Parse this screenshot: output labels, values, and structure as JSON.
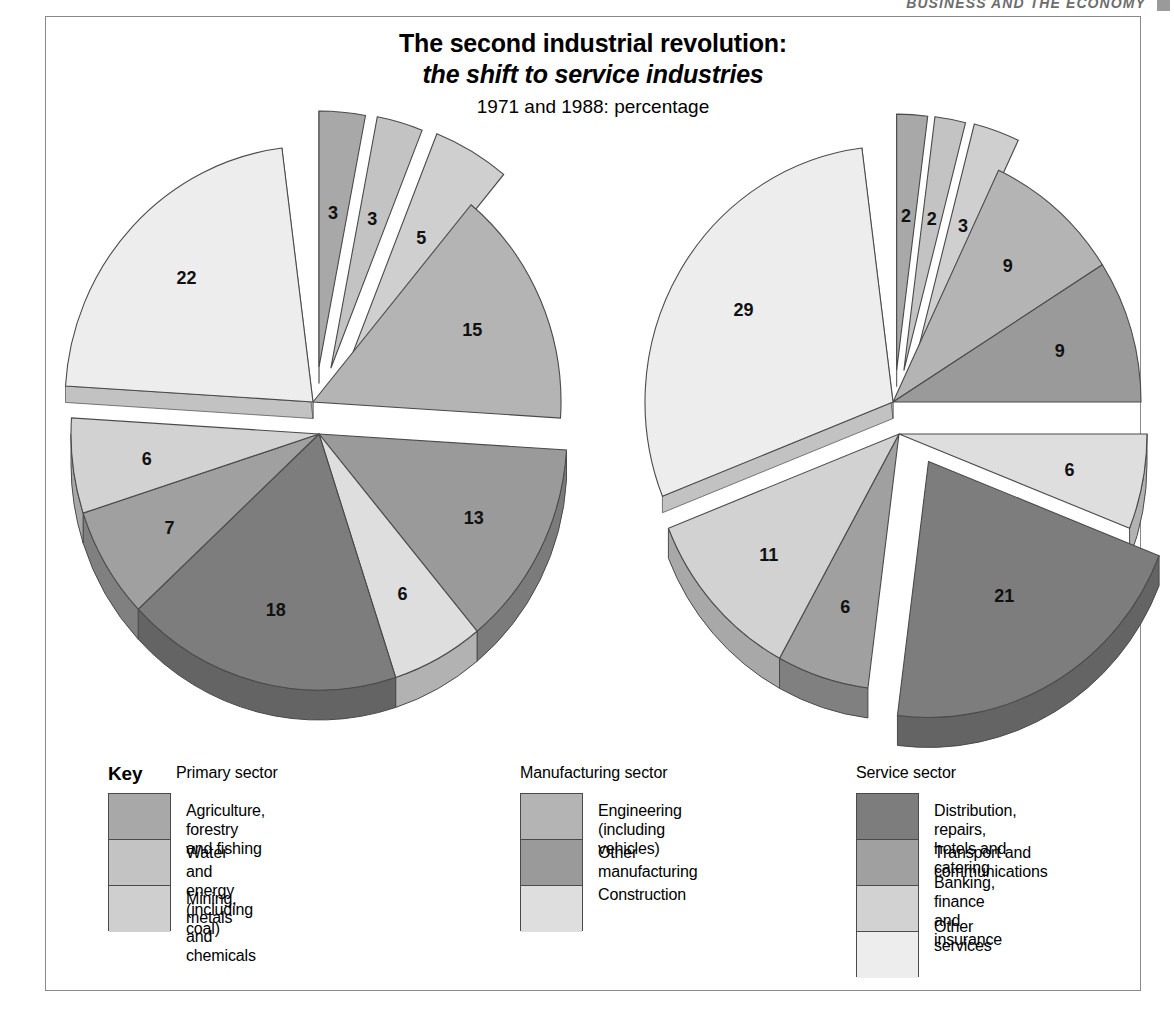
{
  "running_header": {
    "text": "BUSINESS AND THE ECONOMY"
  },
  "title": {
    "line1": "The second industrial revolution:",
    "line2": "the shift to service industries",
    "subtitle": "1971 and 1988: percentage"
  },
  "legend": {
    "key_label": "Key",
    "columns": [
      {
        "heading": "Primary sector",
        "entries": [
          {
            "label": "Agriculture, forestry and fishing",
            "color": "#a8a8a8"
          },
          {
            "label": "Water and energy (including\ncoal)",
            "color": "#c3c3c3"
          },
          {
            "label": "Mining, metals and chemicals",
            "color": "#cfcfcf"
          }
        ]
      },
      {
        "heading": "Manufacturing sector",
        "entries": [
          {
            "label": "Engineering (including\nvehicles)",
            "color": "#b4b4b4"
          },
          {
            "label": "Other manufacturing",
            "color": "#9a9a9a"
          },
          {
            "label": "Construction",
            "color": "#dedede"
          }
        ]
      },
      {
        "heading": "Service sector",
        "entries": [
          {
            "label": "Distribution, repairs, hotels and\ncatering",
            "color": "#7d7d7d"
          },
          {
            "label": "Transport and communications",
            "color": "#a0a0a0"
          },
          {
            "label": "Banking, finance and insurance",
            "color": "#d2d2d2"
          },
          {
            "label": "Other services",
            "color": "#ededed"
          }
        ]
      }
    ]
  },
  "chart_data": [
    {
      "type": "pie",
      "title": "1971",
      "unit": "percentage",
      "total_labelled": 98,
      "slices": [
        {
          "label": "Agriculture, forestry and fishing",
          "value": 3,
          "sector": "Primary",
          "color": "#a8a8a8",
          "exploded": true
        },
        {
          "label": "Water and energy (including coal)",
          "value": 3,
          "sector": "Primary",
          "color": "#c3c3c3",
          "exploded": true
        },
        {
          "label": "Mining, metals and chemicals",
          "value": 5,
          "sector": "Primary",
          "color": "#cfcfcf",
          "exploded": true
        },
        {
          "label": "Engineering (including vehicles)",
          "value": 15,
          "sector": "Manufacturing",
          "color": "#b4b4b4",
          "exploded": false
        },
        {
          "label": "Other manufacturing",
          "value": 13,
          "sector": "Manufacturing",
          "color": "#9a9a9a",
          "exploded": false
        },
        {
          "label": "Construction",
          "value": 6,
          "sector": "Manufacturing",
          "color": "#dedede",
          "exploded": false
        },
        {
          "label": "Distribution, repairs, hotels and catering",
          "value": 18,
          "sector": "Service",
          "color": "#7d7d7d",
          "exploded": false
        },
        {
          "label": "Transport and communications",
          "value": 7,
          "sector": "Service",
          "color": "#a0a0a0",
          "exploded": false
        },
        {
          "label": "Banking, finance and insurance",
          "value": 6,
          "sector": "Service",
          "color": "#d2d2d2",
          "exploded": false
        },
        {
          "label": "Other services",
          "value": 22,
          "sector": "Service",
          "color": "#ededed",
          "exploded": false
        }
      ]
    },
    {
      "type": "pie",
      "title": "1988",
      "unit": "percentage",
      "total_labelled": 98,
      "slices": [
        {
          "label": "Agriculture, forestry and fishing",
          "value": 2,
          "sector": "Primary",
          "color": "#a8a8a8",
          "exploded": true
        },
        {
          "label": "Water and energy (including coal)",
          "value": 2,
          "sector": "Primary",
          "color": "#c3c3c3",
          "exploded": true
        },
        {
          "label": "Mining, metals and chemicals",
          "value": 3,
          "sector": "Primary",
          "color": "#cfcfcf",
          "exploded": true
        },
        {
          "label": "Engineering (including vehicles)",
          "value": 9,
          "sector": "Manufacturing",
          "color": "#b4b4b4",
          "exploded": false
        },
        {
          "label": "Other manufacturing",
          "value": 9,
          "sector": "Manufacturing",
          "color": "#9a9a9a",
          "exploded": false
        },
        {
          "label": "Construction",
          "value": 6,
          "sector": "Manufacturing",
          "color": "#dedede",
          "exploded": false
        },
        {
          "label": "Distribution, repairs, hotels and catering",
          "value": 21,
          "sector": "Service",
          "color": "#7d7d7d",
          "exploded": true
        },
        {
          "label": "Transport and communications",
          "value": 6,
          "sector": "Service",
          "color": "#a0a0a0",
          "exploded": false
        },
        {
          "label": "Banking, finance and insurance",
          "value": 11,
          "sector": "Service",
          "color": "#d2d2d2",
          "exploded": false
        },
        {
          "label": "Other services",
          "value": 29,
          "sector": "Service",
          "color": "#ededed",
          "exploded": false
        }
      ]
    }
  ]
}
